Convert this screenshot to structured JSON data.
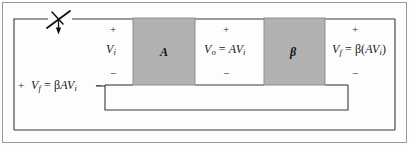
{
  "figure": {
    "type": "feedback-amplifier-block-diagram",
    "background_color": "#ffffff",
    "line_color": "#3a3a3a",
    "block_fill_color": "#b3b3b3",
    "block_stroke_color": "#7a7a7a",
    "text_color": "#1a1a1a"
  },
  "blocks": [
    {
      "id": "amplifier",
      "label": "A",
      "x": 133,
      "y": 18,
      "w": 62,
      "h": 67
    },
    {
      "id": "feedback",
      "label": "β",
      "x": 264,
      "y": 18,
      "w": 61,
      "h": 67
    }
  ],
  "labels": {
    "input_voltage": {
      "symbol": "V",
      "subscript": "i",
      "text": "Vᵢ"
    },
    "output_voltage": {
      "text": "Vₒ = AVᵢ"
    },
    "feedback_voltage_right": {
      "text": "Vғ = β(AVᵢ)"
    },
    "feedback_voltage_left": {
      "text": "Vғ = βAVᵢ"
    }
  },
  "polarity_marks": [
    {
      "id": "vi-plus",
      "sign": "+",
      "x": 112,
      "y": 27
    },
    {
      "id": "vi-minus",
      "sign": "−",
      "x": 112,
      "y": 71
    },
    {
      "id": "vo-plus",
      "sign": "+",
      "x": 225,
      "y": 27
    },
    {
      "id": "vo-minus",
      "sign": "−",
      "x": 225,
      "y": 71
    },
    {
      "id": "vf-plus",
      "sign": "+",
      "x": 355,
      "y": 27
    },
    {
      "id": "vf-minus",
      "sign": "−",
      "x": 355,
      "y": 71
    },
    {
      "id": "vfl-plus",
      "sign": "+",
      "x": 18,
      "y": 82
    },
    {
      "id": "vfl-minus",
      "sign": "−",
      "x": 97,
      "y": 82
    }
  ],
  "switch": {
    "id": "input-switch",
    "description": "open switch with downward arrow on the input line",
    "x": 48,
    "y": 10
  },
  "wires": {
    "top_rail_y": 19,
    "bottom_rail_y": 130,
    "inner_loop_y": 110,
    "left_rail_x": 14,
    "right_rail_x": 395,
    "inner_left_x": 105,
    "inner_right_x": 348
  },
  "outer_border": {
    "x": 2,
    "y": 2,
    "w": 405,
    "h": 141
  }
}
